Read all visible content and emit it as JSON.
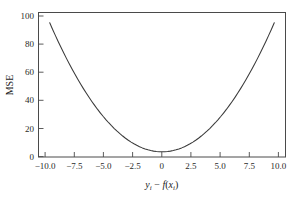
{
  "chart_data": {
    "type": "line",
    "title": "",
    "subtitle": "",
    "xlabel": "y_i - f(x_i)",
    "xlabel_parts": {
      "var1": "y",
      "sub1": "i",
      "operator": "−",
      "func": "f",
      "open": "(",
      "var2": "x",
      "sub2": "i",
      "close": ")"
    },
    "ylabel": "MSE",
    "xlim": [
      -11.0,
      11.0
    ],
    "ylim": [
      -4.0,
      108.0
    ],
    "xticks": [
      -10.0,
      -7.5,
      -5.0,
      -2.5,
      0,
      2.5,
      5.0,
      7.5,
      10.0
    ],
    "xtick_labels": [
      "−10.0",
      "−7.5",
      "−5.0",
      "−2.5",
      "0",
      "2.5",
      "5.0",
      "7.5",
      "10.0"
    ],
    "yticks": [
      0,
      20,
      40,
      60,
      80,
      100
    ],
    "ytick_labels": [
      "0",
      "20",
      "40",
      "60",
      "80",
      "100"
    ],
    "grid": false,
    "legend": null,
    "series": [
      {
        "name": "MSE",
        "formula": "y = x^2",
        "color": "#3a3a3a",
        "x": [
          -10.0,
          -9.75,
          -9.5,
          -9.25,
          -9.0,
          -8.75,
          -8.5,
          -8.25,
          -8.0,
          -7.75,
          -7.5,
          -7.25,
          -7.0,
          -6.75,
          -6.5,
          -6.25,
          -6.0,
          -5.75,
          -5.5,
          -5.25,
          -5.0,
          -4.75,
          -4.5,
          -4.25,
          -4.0,
          -3.75,
          -3.5,
          -3.25,
          -3.0,
          -2.75,
          -2.5,
          -2.25,
          -2.0,
          -1.75,
          -1.5,
          -1.25,
          -1.0,
          -0.75,
          -0.5,
          -0.25,
          0.0,
          0.25,
          0.5,
          0.75,
          1.0,
          1.25,
          1.5,
          1.75,
          2.0,
          2.25,
          2.5,
          2.75,
          3.0,
          3.25,
          3.5,
          3.75,
          4.0,
          4.25,
          4.5,
          4.75,
          5.0,
          5.25,
          5.5,
          5.75,
          6.0,
          6.25,
          6.5,
          6.75,
          7.0,
          7.25,
          7.5,
          7.75,
          8.0,
          8.25,
          8.5,
          8.75,
          9.0,
          9.25,
          9.5,
          9.75,
          10.0
        ],
        "y": [
          100.0,
          95.06,
          90.25,
          85.56,
          81.0,
          76.56,
          72.25,
          68.06,
          64.0,
          60.06,
          56.25,
          52.56,
          49.0,
          45.56,
          42.25,
          39.06,
          36.0,
          33.06,
          30.25,
          27.56,
          25.0,
          22.56,
          20.25,
          18.06,
          16.0,
          14.06,
          12.25,
          10.56,
          9.0,
          7.56,
          6.25,
          5.06,
          4.0,
          3.06,
          2.25,
          1.56,
          1.0,
          0.56,
          0.25,
          0.06,
          0.0,
          0.06,
          0.25,
          0.56,
          1.0,
          1.56,
          2.25,
          3.06,
          4.0,
          5.06,
          6.25,
          7.56,
          9.0,
          10.56,
          12.25,
          14.06,
          16.0,
          18.06,
          20.25,
          22.56,
          25.0,
          27.56,
          30.25,
          33.06,
          36.0,
          39.06,
          42.25,
          45.56,
          49.0,
          52.56,
          56.25,
          60.06,
          64.0,
          68.06,
          72.25,
          76.56,
          81.0,
          85.56,
          90.25,
          95.06,
          100.0
        ]
      }
    ],
    "colors": {
      "background": "#ffffff",
      "axis": "#4a4a4a",
      "curve": "#3a3a3a",
      "text": "#1a1a1a"
    }
  }
}
